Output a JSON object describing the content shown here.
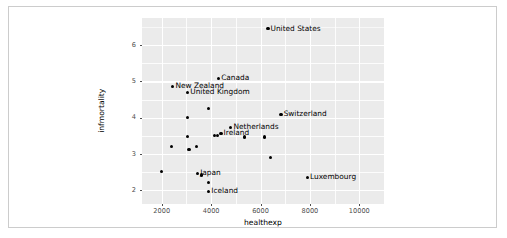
{
  "chart_data": {
    "type": "scatter",
    "title": "",
    "xlabel": "healthexp",
    "ylabel": "infmortality",
    "xlim": [
      1200,
      11000
    ],
    "ylim": [
      1.62,
      6.75
    ],
    "xticks": [
      2000,
      4000,
      6000,
      8000,
      10000
    ],
    "xtick_labels": [
      "2000",
      "4000",
      "6000",
      "8000",
      "10000"
    ],
    "yticks": [
      2,
      3,
      4,
      5,
      6
    ],
    "ytick_labels": [
      "2",
      "3",
      "4",
      "5",
      "6"
    ],
    "grid": true,
    "grid_color": "#ffffff",
    "panel_background": "#ebebeb",
    "point_color": "#000000",
    "legend": "none",
    "points": [
      {
        "label": "United States",
        "x": 6300,
        "y": 6.45,
        "labeled": true
      },
      {
        "label": "Canada",
        "x": 4300,
        "y": 5.08,
        "labeled": true
      },
      {
        "label": "New Zealand",
        "x": 2450,
        "y": 4.87,
        "labeled": true
      },
      {
        "label": "United Kingdom",
        "x": 3050,
        "y": 4.69,
        "labeled": true
      },
      {
        "label": "Switzerland",
        "x": 6830,
        "y": 4.09,
        "labeled": true
      },
      {
        "label": "Netherlands",
        "x": 4800,
        "y": 3.73,
        "labeled": true
      },
      {
        "label": "Ireland",
        "x": 4400,
        "y": 3.56,
        "labeled": true
      },
      {
        "label": "Japan",
        "x": 3450,
        "y": 2.47,
        "labeled": true
      },
      {
        "label": "Iceland",
        "x": 3900,
        "y": 1.97,
        "labeled": true
      },
      {
        "label": "Luxembourg",
        "x": 7900,
        "y": 2.35,
        "labeled": true
      },
      {
        "label": "",
        "x": 3900,
        "y": 4.25,
        "labeled": false
      },
      {
        "label": "",
        "x": 3050,
        "y": 4.0,
        "labeled": false
      },
      {
        "label": "",
        "x": 3050,
        "y": 3.48,
        "labeled": false
      },
      {
        "label": "",
        "x": 2380,
        "y": 3.2,
        "labeled": false
      },
      {
        "label": "",
        "x": 3100,
        "y": 3.12,
        "labeled": false
      },
      {
        "label": "",
        "x": 3400,
        "y": 3.2,
        "labeled": false
      },
      {
        "label": "",
        "x": 4120,
        "y": 3.5,
        "labeled": false
      },
      {
        "label": "",
        "x": 4250,
        "y": 3.5,
        "labeled": false
      },
      {
        "label": "",
        "x": 5350,
        "y": 3.47,
        "labeled": false
      },
      {
        "label": "",
        "x": 6150,
        "y": 3.47,
        "labeled": false
      },
      {
        "label": "",
        "x": 6400,
        "y": 2.9,
        "labeled": false
      },
      {
        "label": "",
        "x": 2000,
        "y": 2.52,
        "labeled": false
      },
      {
        "label": "",
        "x": 3610,
        "y": 2.42,
        "labeled": false
      },
      {
        "label": "",
        "x": 3880,
        "y": 2.22,
        "labeled": false
      }
    ]
  }
}
